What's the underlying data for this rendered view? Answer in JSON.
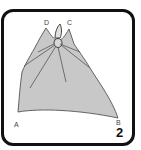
{
  "figure": {
    "step_number": "2",
    "corner_labels": {
      "a": "A",
      "b": "B",
      "c": "C",
      "d": "D"
    },
    "colors": {
      "border": "#111111",
      "cloth_fill": "#c8c8c8",
      "cloth_outline": "#555555",
      "background": "#ffffff"
    }
  }
}
